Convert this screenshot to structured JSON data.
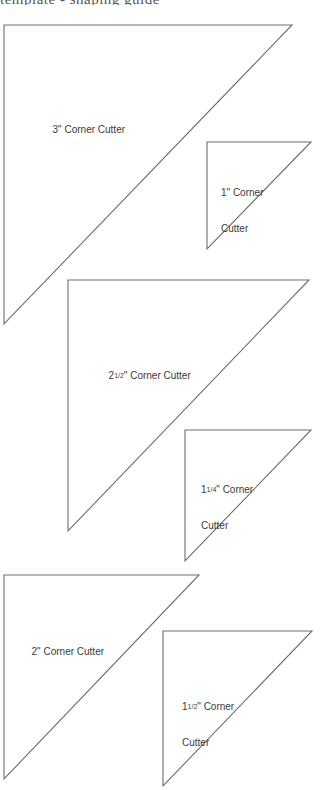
{
  "page": {
    "header_cutoff_text": "template  -  shaping  guide"
  },
  "templates": [
    {
      "id": "3in",
      "label": "3\" Corner Cutter",
      "whole": "3",
      "fraction": "",
      "label_line2": "",
      "points": [
        [
          4,
          25
        ],
        [
          292,
          25
        ],
        [
          4,
          324
        ]
      ]
    },
    {
      "id": "1in",
      "label": "1\" Corner Cutter",
      "whole": "1",
      "fraction": "",
      "label_line2": "Cutter",
      "points": [
        [
          207,
          142
        ],
        [
          311,
          142
        ],
        [
          207,
          249
        ]
      ]
    },
    {
      "id": "2-1-2in",
      "label": "2 1/2\" Corner Cutter",
      "whole": "2",
      "fraction": "1/2",
      "label_line2": "",
      "points": [
        [
          68,
          280
        ],
        [
          309,
          280
        ],
        [
          68,
          531
        ]
      ]
    },
    {
      "id": "1-1-4in",
      "label": "1 1/4\" Corner Cutter",
      "whole": "1",
      "fraction": "1/4",
      "label_line2": "Cutter",
      "points": [
        [
          185,
          430
        ],
        [
          311,
          430
        ],
        [
          185,
          561
        ]
      ]
    },
    {
      "id": "2in",
      "label": "2\" Corner Cutter",
      "whole": "2",
      "fraction": "",
      "label_line2": "",
      "points": [
        [
          4,
          575
        ],
        [
          199,
          575
        ],
        [
          4,
          779
        ]
      ]
    },
    {
      "id": "1-1-2in",
      "label": "1 1/2\" Corner Cutter",
      "whole": "1",
      "fraction": "1/2",
      "label_line2": "Cutter",
      "points": [
        [
          163,
          631
        ],
        [
          312,
          631
        ],
        [
          163,
          786
        ]
      ]
    }
  ],
  "labels": {
    "t3": {
      "line1": "3\" Corner Cutter"
    },
    "t1": {
      "line1": "1\" Corner",
      "line2": "Cutter"
    },
    "t25": {
      "whole": "2",
      "frac": "1/2",
      "rest": "\" Corner Cutter"
    },
    "t125": {
      "whole": "1",
      "frac": "1/4",
      "rest": "\" Corner",
      "line2": "Cutter"
    },
    "t2": {
      "line1": "2\" Corner Cutter"
    },
    "t15": {
      "whole": "1",
      "frac": "1/2",
      "rest": "\" Corner",
      "line2": "Cutter"
    }
  },
  "colors": {
    "outline": "#6e6e6e",
    "text": "#3a3a3a",
    "background": "#ffffff"
  }
}
